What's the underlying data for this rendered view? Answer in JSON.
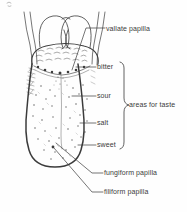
{
  "figure": {
    "ink_color": "#3b3b3b",
    "background_color": "#fefefe",
    "labels": {
      "vallate_papilla": "vallate papilla",
      "bitter": "bitter",
      "sour": "sour",
      "salt": "salt",
      "sweet": "sweet",
      "areas_for_taste": "areas for taste",
      "fungiform_papilla": "fungiform papilla",
      "filiform_papilla": "filiform papilla"
    }
  }
}
